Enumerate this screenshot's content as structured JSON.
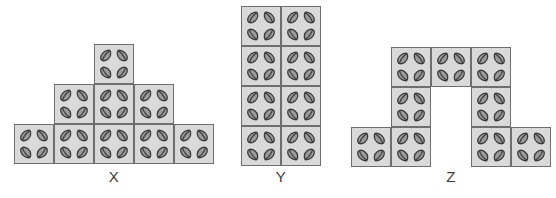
{
  "canvas": {
    "width": 556,
    "height": 198,
    "background": "#ffffff"
  },
  "style": {
    "tile_fill": "#d9d9d9",
    "tile_border": "#6e6e6e",
    "leaf_fill": "#9a9a9a",
    "leaf_stroke": "#3a3a3a",
    "label_color": "#3b3b3b",
    "tile_size_px": 40,
    "leaf_icon": "leaf-icon",
    "leaves_per_tile": 4,
    "leaf_positions": [
      "top-left",
      "top-right",
      "bottom-left",
      "bottom-right"
    ]
  },
  "figures": [
    {
      "id": "X",
      "label": "X",
      "shape": "pyramid",
      "origin": {
        "x": 14,
        "y": 44
      },
      "cols": 5,
      "rows": 3,
      "tile_count": 9,
      "cells": [
        {
          "col": 2,
          "row": 0
        },
        {
          "col": 1,
          "row": 1
        },
        {
          "col": 2,
          "row": 1
        },
        {
          "col": 3,
          "row": 1
        },
        {
          "col": 0,
          "row": 2
        },
        {
          "col": 1,
          "row": 2
        },
        {
          "col": 2,
          "row": 2
        },
        {
          "col": 3,
          "row": 2
        },
        {
          "col": 4,
          "row": 2
        }
      ],
      "label_pos": {
        "x": 14,
        "y": 168,
        "width": 200
      }
    },
    {
      "id": "Y",
      "label": "Y",
      "shape": "rectangle",
      "origin": {
        "x": 241,
        "y": 6
      },
      "cols": 2,
      "rows": 4,
      "tile_count": 8,
      "cells": [
        {
          "col": 0,
          "row": 0
        },
        {
          "col": 1,
          "row": 0
        },
        {
          "col": 0,
          "row": 1
        },
        {
          "col": 1,
          "row": 1
        },
        {
          "col": 0,
          "row": 2
        },
        {
          "col": 1,
          "row": 2
        },
        {
          "col": 0,
          "row": 3
        },
        {
          "col": 1,
          "row": 3
        }
      ],
      "label_pos": {
        "x": 241,
        "y": 168,
        "width": 80
      }
    },
    {
      "id": "Z",
      "label": "Z",
      "shape": "inverted-u",
      "origin": {
        "x": 351,
        "y": 47
      },
      "cols": 5,
      "rows": 3,
      "tile_count": 9,
      "cells": [
        {
          "col": 1,
          "row": 0
        },
        {
          "col": 2,
          "row": 0
        },
        {
          "col": 3,
          "row": 0
        },
        {
          "col": 1,
          "row": 1
        },
        {
          "col": 3,
          "row": 1
        },
        {
          "col": 0,
          "row": 2
        },
        {
          "col": 1,
          "row": 2
        },
        {
          "col": 3,
          "row": 2
        },
        {
          "col": 4,
          "row": 2
        }
      ],
      "label_pos": {
        "x": 351,
        "y": 168,
        "width": 200
      }
    }
  ]
}
